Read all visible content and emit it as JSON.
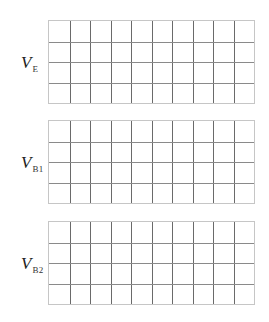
{
  "diagram": {
    "type": "oscilloscope-style blank timing grids",
    "columns": 10,
    "rows": 4,
    "panels": [
      {
        "id": "ve",
        "label_main": "V",
        "label_sub": "E",
        "top": 20
      },
      {
        "id": "vb1",
        "label_main": "V",
        "label_sub": "B1",
        "top": 120
      },
      {
        "id": "vb2",
        "label_main": "V",
        "label_sub": "B2",
        "top": 221
      }
    ],
    "colors": {
      "border": "#c6c6c6",
      "vertical_lines": "#6a6a6a",
      "horizontal_lines": "#8a8a8a",
      "background": "#ffffff"
    }
  }
}
